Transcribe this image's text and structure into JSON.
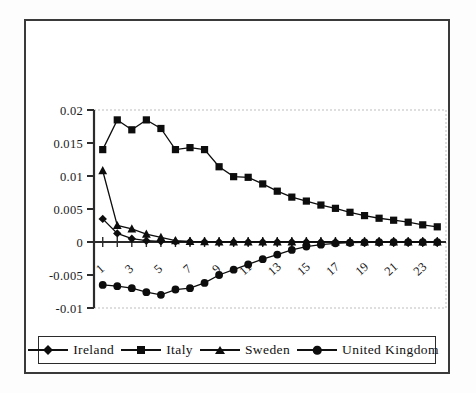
{
  "chart_data": {
    "type": "line",
    "title": "",
    "subtitle": "",
    "xlabel": "",
    "ylabel": "",
    "grid": false,
    "legend_position": "bottom",
    "x": [
      1,
      2,
      3,
      4,
      5,
      6,
      7,
      8,
      9,
      10,
      11,
      12,
      13,
      14,
      15,
      16,
      17,
      18,
      19,
      20,
      21,
      22,
      23,
      24
    ],
    "x_tick_labels": [
      "1",
      "3",
      "5",
      "7",
      "9",
      "11",
      "13",
      "15",
      "17",
      "19",
      "21",
      "23"
    ],
    "x_tick_values": [
      1,
      3,
      5,
      7,
      9,
      11,
      13,
      15,
      17,
      19,
      21,
      23
    ],
    "y_tick_labels": [
      "0.02",
      "0.015",
      "0.01",
      "0.005",
      "0",
      "-0.005",
      "-0.01"
    ],
    "y_tick_values": [
      0.02,
      0.015,
      0.01,
      0.005,
      0,
      -0.005,
      -0.01
    ],
    "ylim": [
      -0.01,
      0.02
    ],
    "xlim": [
      0.4,
      24.6
    ],
    "series": [
      {
        "name": "Ireland",
        "marker": "diamond",
        "color": "#0d0d0d",
        "values": [
          0.0035,
          0.0013,
          0.0005,
          0.0002,
          0.0001,
          5e-05,
          3e-05,
          2e-05,
          1e-05,
          1e-05,
          1e-05,
          1e-05,
          1e-05,
          1e-05,
          1e-05,
          1e-05,
          1e-05,
          1e-05,
          1e-05,
          1e-05,
          1e-05,
          1e-05,
          1e-05,
          1e-05
        ]
      },
      {
        "name": "Italy",
        "marker": "square",
        "color": "#0d0d0d",
        "values": [
          0.014,
          0.0185,
          0.017,
          0.0185,
          0.0172,
          0.014,
          0.0143,
          0.014,
          0.0114,
          0.0099,
          0.0098,
          0.0088,
          0.0077,
          0.0068,
          0.0062,
          0.0056,
          0.0051,
          0.0045,
          0.004,
          0.0036,
          0.0033,
          0.003,
          0.0026,
          0.0023
        ]
      },
      {
        "name": "Sweden",
        "marker": "triangle",
        "color": "#0d0d0d",
        "values": [
          0.0108,
          0.0025,
          0.002,
          0.0012,
          0.0007,
          0.0002,
          0.0001,
          5e-05,
          3e-05,
          2e-05,
          1e-05,
          1e-05,
          1e-05,
          1e-05,
          1e-05,
          1e-05,
          1e-05,
          1e-05,
          1e-05,
          1e-05,
          1e-05,
          1e-05,
          1e-05,
          1e-05
        ]
      },
      {
        "name": "United Kingdom",
        "marker": "circle",
        "color": "#0d0d0d",
        "values": [
          -0.0065,
          -0.0067,
          -0.007,
          -0.0076,
          -0.008,
          -0.0072,
          -0.007,
          -0.0062,
          -0.005,
          -0.0042,
          -0.0034,
          -0.0026,
          -0.0019,
          -0.0012,
          -0.0007,
          -0.0004,
          -0.0002,
          -0.0001,
          -5e-05,
          -2e-05,
          -1e-05,
          -1e-05,
          -1e-05,
          -1e-05
        ]
      }
    ]
  },
  "legend": {
    "items": [
      {
        "label": "Ireland",
        "marker": "diamond"
      },
      {
        "label": "Italy",
        "marker": "square"
      },
      {
        "label": "Sweden",
        "marker": "triangle"
      },
      {
        "label": "United  Kingdom",
        "marker": "circle"
      }
    ]
  }
}
